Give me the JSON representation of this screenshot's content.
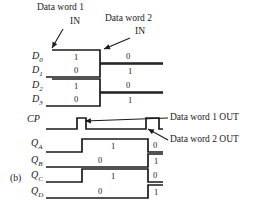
{
  "figure": {
    "panel_label": "(b)",
    "background": "#ffffff",
    "line_color": "#1a1a1a"
  },
  "annotations": [
    {
      "name": "data-word-1-in",
      "line1": "Data word 1",
      "line2": "IN",
      "x": 37,
      "y": 2,
      "x2": 70,
      "y2": 16,
      "arrow": {
        "x1": 63,
        "y1": 29,
        "x2": 52,
        "y2": 48
      }
    },
    {
      "name": "data-word-2-in",
      "line1": "Data word 2",
      "line2": "IN",
      "x": 105,
      "y": 13,
      "x2": 135,
      "y2": 26,
      "arrow": {
        "x1": 130,
        "y1": 38,
        "x2": 104,
        "y2": 49
      }
    },
    {
      "name": "data-word-1-out",
      "line1": "Data word 1 OUT",
      "line2": "",
      "x": 170,
      "y": 112,
      "x2": 0,
      "y2": 0,
      "arrow": {
        "x1": 168,
        "y1": 118,
        "x2": 85,
        "y2": 121
      }
    },
    {
      "name": "data-word-2-out",
      "line1": "Data word 2 OUT",
      "line2": "",
      "x": 170,
      "y": 134,
      "x2": 0,
      "y2": 0,
      "arrow": {
        "x1": 168,
        "y1": 140,
        "x2": 148,
        "y2": 129
      }
    }
  ],
  "signals": [
    {
      "name": "D0",
      "label_html": "D",
      "label_sub": "0",
      "label_x": 32,
      "label_y": 50,
      "baseline_y": 63,
      "top_y": 50,
      "type": "data",
      "segments": [
        {
          "level": 1,
          "x1": 52,
          "x2": 100,
          "value": "1",
          "value_x": 76,
          "value_y": 52
        },
        {
          "level": 0,
          "x1": 100,
          "x2": 163,
          "value": "0",
          "value_x": 128,
          "value_y": 51
        }
      ]
    },
    {
      "name": "D1",
      "label_html": "D",
      "label_sub": "1",
      "label_x": 32,
      "label_y": 64,
      "baseline_y": 77,
      "top_y": 64,
      "type": "data",
      "segments": [
        {
          "level": 0,
          "x1": 46,
          "x2": 100,
          "value": "0",
          "value_x": 76,
          "value_y": 65
        },
        {
          "level": 1,
          "x1": 100,
          "x2": 163,
          "value": "1",
          "value_x": 130,
          "value_y": 66
        }
      ]
    },
    {
      "name": "D2",
      "label_html": "D",
      "label_sub": "2",
      "label_x": 32,
      "label_y": 79,
      "baseline_y": 92,
      "top_y": 79,
      "type": "data",
      "segments": [
        {
          "level": 1,
          "x1": 52,
          "x2": 100,
          "value": "1",
          "value_x": 76,
          "value_y": 81
        },
        {
          "level": 0,
          "x1": 100,
          "x2": 163,
          "value": "0",
          "value_x": 128,
          "value_y": 80
        }
      ]
    },
    {
      "name": "D3",
      "label_html": "D",
      "label_sub": "3",
      "label_x": 32,
      "label_y": 93,
      "baseline_y": 106,
      "top_y": 93,
      "type": "data",
      "segments": [
        {
          "level": 0,
          "x1": 46,
          "x2": 100,
          "value": "0",
          "value_x": 76,
          "value_y": 94
        },
        {
          "level": 1,
          "x1": 100,
          "x2": 163,
          "value": "1",
          "value_x": 130,
          "value_y": 95
        }
      ]
    },
    {
      "name": "CP",
      "label_html": "CP",
      "label_sub": "",
      "label_x": 27,
      "label_y": 113,
      "baseline_y": 129,
      "top_y": 118,
      "type": "clock",
      "pulses": [
        {
          "x1": 77,
          "x2": 86
        },
        {
          "x1": 146,
          "x2": 159
        }
      ],
      "start_x": 46,
      "end_x": 163
    },
    {
      "name": "QA",
      "label_html": "Q",
      "label_sub": "A",
      "label_x": 31,
      "label_y": 137,
      "baseline_y": 152,
      "top_y": 139,
      "type": "data",
      "segments": [
        {
          "level": 0,
          "x1": 46,
          "x2": 82,
          "value": "",
          "value_x": 0,
          "value_y": 0
        },
        {
          "level": 1,
          "x1": 82,
          "x2": 148,
          "value": "1",
          "value_x": 113,
          "value_y": 141
        },
        {
          "level": 0,
          "x1": 148,
          "x2": 163,
          "value": "0",
          "value_x": 155,
          "value_y": 140
        }
      ]
    },
    {
      "name": "QB",
      "label_html": "Q",
      "label_sub": "B",
      "label_x": 31,
      "label_y": 154,
      "baseline_y": 167,
      "top_y": 154,
      "type": "data",
      "segments": [
        {
          "level": 0,
          "x1": 46,
          "x2": 148,
          "value": "0",
          "value_x": 100,
          "value_y": 155
        },
        {
          "level": 1,
          "x1": 148,
          "x2": 163,
          "value": "1",
          "value_x": 156,
          "value_y": 156
        }
      ]
    },
    {
      "name": "QC",
      "label_html": "Q",
      "label_sub": "C",
      "label_x": 31,
      "label_y": 169,
      "baseline_y": 182,
      "top_y": 169,
      "type": "data",
      "segments": [
        {
          "level": 0,
          "x1": 46,
          "x2": 82,
          "value": "",
          "value_x": 0,
          "value_y": 0
        },
        {
          "level": 1,
          "x1": 82,
          "x2": 148,
          "value": "1",
          "value_x": 113,
          "value_y": 171
        },
        {
          "level": 0,
          "x1": 148,
          "x2": 163,
          "value": "0",
          "value_x": 155,
          "value_y": 170
        }
      ]
    },
    {
      "name": "QD",
      "label_html": "Q",
      "label_sub": "D",
      "label_x": 31,
      "label_y": 185,
      "baseline_y": 198,
      "top_y": 185,
      "type": "data",
      "segments": [
        {
          "level": 0,
          "x1": 46,
          "x2": 148,
          "value": "0",
          "value_x": 100,
          "value_y": 186
        },
        {
          "level": 1,
          "x1": 148,
          "x2": 163,
          "value": "1",
          "value_x": 156,
          "value_y": 187
        }
      ]
    }
  ]
}
